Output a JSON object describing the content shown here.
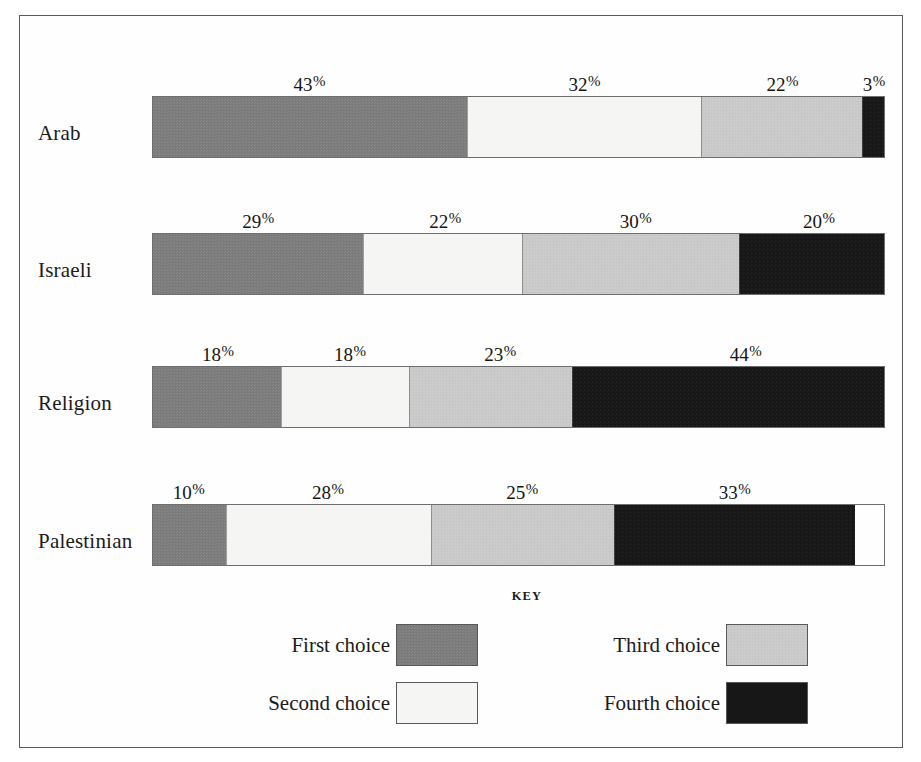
{
  "chart_data": {
    "type": "bar",
    "subtype": "stacked-horizontal-100-percent",
    "title": "",
    "xlabel": "",
    "ylabel": "",
    "xlim": [
      0,
      100
    ],
    "grid": false,
    "unit": "%",
    "legend_position": "bottom",
    "legend_title": "KEY",
    "categories": [
      "Arab",
      "Israeli",
      "Religion",
      "Palestinian"
    ],
    "series": [
      {
        "name": "First choice",
        "color": "#7d7d7d",
        "values": [
          43,
          29,
          18,
          10
        ]
      },
      {
        "name": "Second choice",
        "color": "#f5f5f3",
        "values": [
          32,
          22,
          18,
          28
        ]
      },
      {
        "name": "Third choice",
        "color": "#cbcbcb",
        "values": [
          22,
          30,
          23,
          25
        ]
      },
      {
        "name": "Fourth choice",
        "color": "#171717",
        "values": [
          3,
          20,
          44,
          33
        ]
      }
    ]
  },
  "rows": [
    {
      "label": "Arab",
      "segments": [
        {
          "series": "First choice",
          "value": 43,
          "label": "43",
          "suffix": "%",
          "color_key": "c1"
        },
        {
          "series": "Second choice",
          "value": 32,
          "label": "32",
          "suffix": "%",
          "color_key": "c2"
        },
        {
          "series": "Third choice",
          "value": 22,
          "label": "22",
          "suffix": "%",
          "color_key": "c3"
        },
        {
          "series": "Fourth choice",
          "value": 3,
          "label": "3",
          "suffix": "%",
          "color_key": "c4"
        }
      ]
    },
    {
      "label": "Israeli",
      "segments": [
        {
          "series": "First choice",
          "value": 29,
          "label": "29",
          "suffix": "%",
          "color_key": "c1"
        },
        {
          "series": "Second choice",
          "value": 22,
          "label": "22",
          "suffix": "%",
          "color_key": "c2"
        },
        {
          "series": "Third choice",
          "value": 30,
          "label": "30",
          "suffix": "%",
          "color_key": "c3"
        },
        {
          "series": "Fourth choice",
          "value": 20,
          "label": "20",
          "suffix": "%",
          "color_key": "c4"
        }
      ]
    },
    {
      "label": "Religion",
      "segments": [
        {
          "series": "First choice",
          "value": 18,
          "label": "18",
          "suffix": "%",
          "color_key": "c1"
        },
        {
          "series": "Second choice",
          "value": 18,
          "label": "18",
          "suffix": "%",
          "color_key": "c2"
        },
        {
          "series": "Third choice",
          "value": 23,
          "label": "23",
          "suffix": "%",
          "color_key": "c3"
        },
        {
          "series": "Fourth choice",
          "value": 44,
          "label": "44",
          "suffix": "%",
          "color_key": "c4"
        }
      ]
    },
    {
      "label": "Palestinian",
      "segments": [
        {
          "series": "First choice",
          "value": 10,
          "label": "10",
          "suffix": "%",
          "color_key": "c1"
        },
        {
          "series": "Second choice",
          "value": 28,
          "label": "28",
          "suffix": "%",
          "color_key": "c2"
        },
        {
          "series": "Third choice",
          "value": 25,
          "label": "25",
          "suffix": "%",
          "color_key": "c3"
        },
        {
          "series": "Fourth choice",
          "value": 33,
          "label": "33",
          "suffix": "%",
          "color_key": "c4"
        }
      ]
    }
  ],
  "key": {
    "title": "KEY",
    "items": [
      {
        "label": "First choice",
        "color": "#7d7d7d",
        "color_key": "c1"
      },
      {
        "label": "Second choice",
        "color": "#f5f5f3",
        "color_key": "c2"
      },
      {
        "label": "Third choice",
        "color": "#cbcbcb",
        "color_key": "c3"
      },
      {
        "label": "Fourth choice",
        "color": "#171717",
        "color_key": "c4"
      }
    ]
  }
}
